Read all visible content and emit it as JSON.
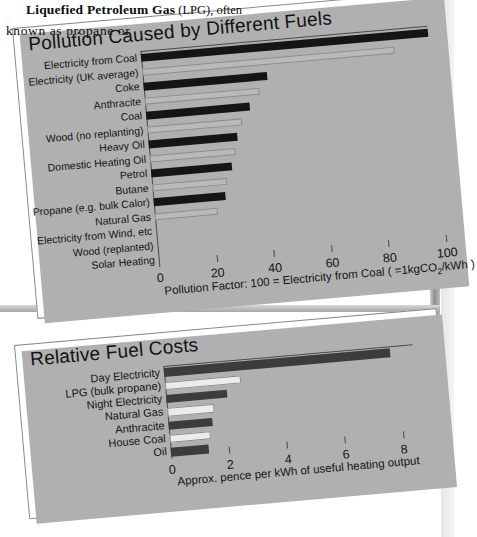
{
  "document": {
    "body_text": {
      "line1_bold": "Liquefied Petroleum Gas",
      "line1_rest": " (LPG), often",
      "line2": "known  as  propane  or"
    }
  },
  "colors": {
    "bar_dark_top": "#151515",
    "bar_light_top": "#b9b9b9",
    "bar_dark_bottom": "#3c3c3c",
    "bar_light_bottom": "#ececec",
    "axis": "#4a4a4a",
    "panel_border": "#8a8a8a",
    "page_shadow": "#b0b0b0"
  },
  "chart_data": [
    {
      "type": "bar",
      "id": "pollution",
      "title": "Pollution Caused by Different Fuels",
      "orientation": "horizontal",
      "xlabel": "Pollution Factor: 100 = Electricity from Coal ( =1kgCO2/kWh )",
      "xlabel_parts": {
        "pre": "Pollution Factor: 100 = Electricity from Coal ( =1kgCO",
        "sub": "2",
        "post": "/kWh )"
      },
      "ylabel": "",
      "xlim": [
        0,
        100
      ],
      "xticks": [
        0,
        20,
        40,
        60,
        80,
        100
      ],
      "xtick_labels": [
        "0",
        "20",
        "40",
        "60",
        "80",
        "100"
      ],
      "grid": false,
      "legend": "none",
      "categories": [
        "Electricity from Coal",
        "Electricity (UK average)",
        "Coke",
        "Anthracite",
        "Coal",
        "Wood (no replanting)",
        "Heavy Oil",
        "Domestic Heating Oil",
        "Petrol",
        "Butane",
        "Propane (e.g. bulk Calor)",
        "Natural Gas",
        "Electricity from Wind, etc",
        "Wood (replanted)",
        "Solar Heating"
      ],
      "values": [
        100,
        88,
        43,
        40,
        36,
        33,
        31,
        30,
        28,
        26,
        25,
        22,
        0,
        0,
        0
      ],
      "bar_colors": [
        "#151515",
        "#b9b9b9",
        "#151515",
        "#b9b9b9",
        "#151515",
        "#b9b9b9",
        "#151515",
        "#b9b9b9",
        "#151515",
        "#b9b9b9",
        "#151515",
        "#b9b9b9",
        "#151515",
        "#b9b9b9",
        "#151515"
      ]
    },
    {
      "type": "bar",
      "id": "costs",
      "title": "Relative Fuel Costs",
      "orientation": "horizontal",
      "xlabel": "Approx. pence per kWh of useful heating output",
      "ylabel": "",
      "xlim": [
        0,
        8.6
      ],
      "xticks": [
        0,
        2,
        4,
        6,
        8
      ],
      "xtick_labels": [
        "0",
        "2",
        "4",
        "6",
        "8"
      ],
      "grid": false,
      "legend": "none",
      "categories": [
        "Day Electricity",
        "LPG (bulk propane)",
        "Night Electricity",
        "Natural Gas",
        "Anthracite",
        "House Coal",
        "Oil"
      ],
      "values": [
        7.8,
        2.6,
        2.1,
        1.6,
        1.5,
        1.4,
        1.3
      ],
      "bar_colors": [
        "#3c3c3c",
        "#ececec",
        "#3c3c3c",
        "#ececec",
        "#3c3c3c",
        "#ececec",
        "#3c3c3c"
      ]
    }
  ]
}
